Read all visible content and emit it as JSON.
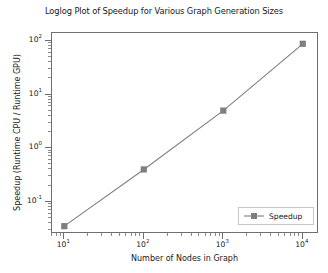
{
  "chart_data": {
    "type": "line",
    "title": "Loglog Plot of Speedup for Various Graph Generation Sizes",
    "xlabel": "Number of Nodes in Graph",
    "ylabel": "Speedup (Runtime CPU / Runtime GPU)",
    "xscale": "log",
    "yscale": "log",
    "xlim": [
      7,
      16000
    ],
    "ylim": [
      0.025,
      140
    ],
    "grid": false,
    "legend_position": "lower right",
    "x": [
      10,
      100,
      1000,
      10000
    ],
    "series": [
      {
        "name": "Speedup",
        "values": [
          0.035,
          0.4,
          5.0,
          88.0
        ],
        "color": "#7f7f7f",
        "marker": "square",
        "linestyle": "solid"
      }
    ],
    "xticks": [
      {
        "value": 10,
        "label_base": "10",
        "label_exp": "1"
      },
      {
        "value": 100,
        "label_base": "10",
        "label_exp": "2"
      },
      {
        "value": 1000,
        "label_base": "10",
        "label_exp": "3"
      },
      {
        "value": 10000,
        "label_base": "10",
        "label_exp": "4"
      }
    ],
    "yticks": [
      {
        "value": 0.1,
        "label_base": "10",
        "label_exp": "-1"
      },
      {
        "value": 1,
        "label_base": "10",
        "label_exp": "0"
      },
      {
        "value": 10,
        "label_base": "10",
        "label_exp": "1"
      },
      {
        "value": 100,
        "label_base": "10",
        "label_exp": "2"
      }
    ]
  },
  "legend": {
    "entries": [
      {
        "label": "Speedup"
      }
    ]
  },
  "colors": {
    "series": "#7f7f7f",
    "axis": "#6f6f6f",
    "text": "#1a1a1a",
    "background": "#ffffff",
    "legend_border": "#c8c8c8"
  }
}
